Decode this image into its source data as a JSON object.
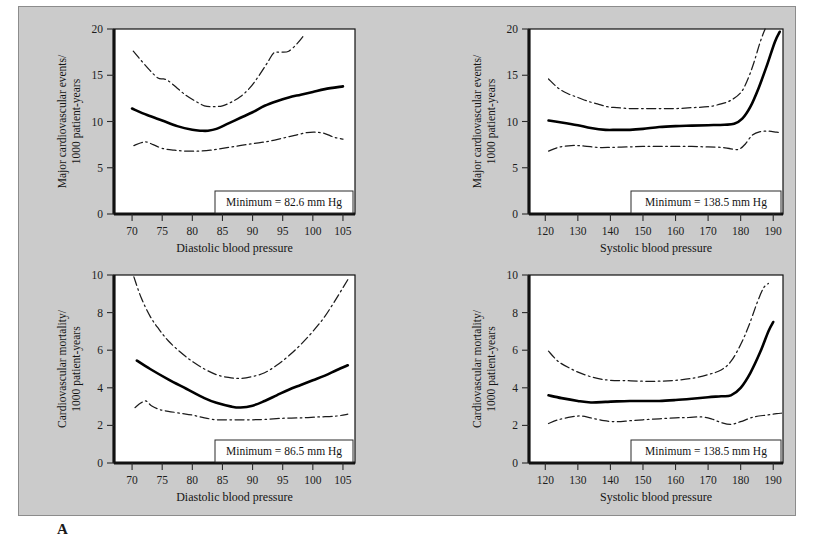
{
  "figure": {
    "panel_label": "A",
    "background_color": "#cbcbcb",
    "plot_background_color": "#ffffff",
    "curve_color": "#000000",
    "ci_color": "#1b1b1b"
  },
  "chart_data": [
    {
      "id": "top-left",
      "type": "line",
      "title": "",
      "xlabel": "Diastolic blood pressure",
      "ylabel": "Major cardiovascular events/\n1000 patient-years",
      "ylabel_line1": "Major cardiovascular events/",
      "ylabel_line2": "1000 patient-years",
      "xlim": [
        67,
        107
      ],
      "ylim": [
        0,
        20
      ],
      "xticks": [
        70,
        75,
        80,
        85,
        90,
        95,
        100,
        105
      ],
      "yticks": [
        0,
        5,
        10,
        15,
        20
      ],
      "grid": false,
      "legend": "none",
      "annotation": "Minimum = 82.6 mm Hg",
      "minimum_value": 82.6,
      "minimum_units": "mm Hg",
      "series": [
        {
          "name": "upper-confidence-limit",
          "style": "dash-dot",
          "x": [
            70.2,
            71.5,
            73.0,
            74.3,
            75.2,
            76.0,
            77.5,
            79.0,
            80.5,
            82.0,
            83.5,
            85.0,
            86.5,
            88.0,
            89.5,
            91.0,
            92.5,
            93.5,
            94.5,
            96.0,
            97.5,
            98.5
          ],
          "y": [
            17.6,
            16.6,
            15.5,
            14.7,
            14.6,
            14.4,
            13.6,
            12.8,
            12.2,
            11.7,
            11.6,
            11.7,
            12.1,
            12.7,
            13.6,
            14.9,
            16.4,
            17.4,
            17.5,
            17.6,
            18.5,
            19.3
          ]
        },
        {
          "name": "fitted-risk",
          "style": "solid",
          "x": [
            70.0,
            72.5,
            75.0,
            77.5,
            80.0,
            81.5,
            82.6,
            84.0,
            86.0,
            88.0,
            90.0,
            92.0,
            94.0,
            96.0,
            98.0,
            100.0,
            102.0,
            105.0
          ],
          "y": [
            11.4,
            10.7,
            10.1,
            9.5,
            9.1,
            9.0,
            9.0,
            9.2,
            9.8,
            10.4,
            11.0,
            11.7,
            12.2,
            12.6,
            12.9,
            13.2,
            13.5,
            13.8
          ]
        },
        {
          "name": "lower-confidence-limit",
          "style": "dash-dot",
          "x": [
            70.3,
            71.5,
            72.3,
            73.5,
            75.0,
            77.0,
            79.0,
            81.0,
            83.0,
            85.0,
            87.0,
            89.0,
            91.0,
            93.0,
            95.0,
            97.0,
            99.0,
            100.5,
            102.0,
            103.5,
            105.0
          ],
          "y": [
            7.4,
            7.7,
            7.8,
            7.5,
            7.1,
            6.9,
            6.8,
            6.8,
            6.9,
            7.1,
            7.3,
            7.5,
            7.7,
            7.9,
            8.2,
            8.5,
            8.8,
            8.85,
            8.7,
            8.3,
            8.1
          ]
        }
      ]
    },
    {
      "id": "top-right",
      "type": "line",
      "title": "",
      "xlabel": "Systolic blood pressure",
      "ylabel_line1": "Major cardiovascular events/",
      "ylabel_line2": "1000 patient-years",
      "xlim": [
        115,
        193
      ],
      "ylim": [
        0,
        20
      ],
      "xticks": [
        120,
        130,
        140,
        150,
        160,
        170,
        180,
        190
      ],
      "yticks": [
        0,
        5,
        10,
        15,
        20
      ],
      "grid": false,
      "legend": "none",
      "annotation": "Minimum = 138.5 mm Hg",
      "minimum_value": 138.5,
      "minimum_units": "mm Hg",
      "series": [
        {
          "name": "upper-confidence-limit",
          "style": "dash-dot",
          "x": [
            121.0,
            124.0,
            127.0,
            130.0,
            133.0,
            136.0,
            139.0,
            142.0,
            146.0,
            150.0,
            155.0,
            160.0,
            165.0,
            170.0,
            174.0,
            177.0,
            180.0,
            182.0,
            184.0,
            186.0,
            187.5
          ],
          "y": [
            14.6,
            13.6,
            13.0,
            12.6,
            12.2,
            11.9,
            11.6,
            11.5,
            11.4,
            11.4,
            11.4,
            11.4,
            11.5,
            11.6,
            11.9,
            12.3,
            13.1,
            14.4,
            16.3,
            18.6,
            20.0
          ]
        },
        {
          "name": "fitted-risk",
          "style": "solid",
          "x": [
            121.0,
            125.0,
            130.0,
            134.0,
            138.5,
            142.0,
            146.0,
            150.0,
            155.0,
            160.0,
            165.0,
            170.0,
            175.0,
            178.0,
            180.5,
            183.0,
            185.5,
            188.0,
            190.5,
            192.0
          ],
          "y": [
            10.1,
            9.9,
            9.6,
            9.3,
            9.1,
            9.1,
            9.1,
            9.2,
            9.4,
            9.5,
            9.55,
            9.6,
            9.65,
            9.75,
            10.3,
            11.6,
            13.6,
            16.0,
            18.6,
            19.7
          ]
        },
        {
          "name": "lower-confidence-limit",
          "style": "dash-dot",
          "x": [
            121.0,
            124.0,
            128.0,
            132.0,
            136.0,
            140.0,
            145.0,
            150.0,
            155.0,
            160.0,
            165.0,
            170.0,
            174.0,
            177.0,
            179.5,
            181.5,
            183.5,
            186.0,
            188.5,
            191.0,
            192.5
          ],
          "y": [
            6.8,
            7.2,
            7.4,
            7.35,
            7.2,
            7.2,
            7.25,
            7.3,
            7.3,
            7.3,
            7.3,
            7.25,
            7.2,
            7.05,
            7.0,
            7.6,
            8.5,
            8.9,
            8.95,
            8.85,
            8.8
          ]
        }
      ]
    },
    {
      "id": "bottom-left",
      "type": "line",
      "title": "",
      "xlabel": "Diastolic blood pressure",
      "ylabel_line1": "Cardiovascular mortality/",
      "ylabel_line2": "1000 patient-years",
      "xlim": [
        67,
        107
      ],
      "ylim": [
        0,
        10
      ],
      "xticks": [
        70,
        75,
        80,
        85,
        90,
        95,
        100,
        105
      ],
      "yticks": [
        0,
        2,
        4,
        6,
        8,
        10
      ],
      "grid": false,
      "legend": "none",
      "annotation": "Minimum = 86.5 mm Hg",
      "minimum_value": 86.5,
      "minimum_units": "mm Hg",
      "series": [
        {
          "name": "upper-confidence-limit",
          "style": "dash-dot",
          "x": [
            70.3,
            71.5,
            73.0,
            74.5,
            76.0,
            78.0,
            80.0,
            82.0,
            84.0,
            86.0,
            88.0,
            90.0,
            92.0,
            94.0,
            96.0,
            98.0,
            100.0,
            102.0,
            104.0,
            105.8
          ],
          "y": [
            9.9,
            8.8,
            7.8,
            7.1,
            6.5,
            5.9,
            5.4,
            5.0,
            4.7,
            4.55,
            4.5,
            4.6,
            4.8,
            5.2,
            5.7,
            6.3,
            7.0,
            7.8,
            8.8,
            9.75
          ]
        },
        {
          "name": "fitted-risk",
          "style": "solid",
          "x": [
            70.8,
            73.0,
            76.0,
            79.0,
            82.0,
            84.0,
            86.5,
            88.0,
            90.0,
            92.0,
            94.0,
            96.0,
            98.0,
            100.0,
            102.0,
            104.0,
            105.8
          ],
          "y": [
            5.45,
            5.0,
            4.45,
            3.95,
            3.45,
            3.2,
            3.0,
            2.95,
            3.05,
            3.3,
            3.6,
            3.9,
            4.15,
            4.4,
            4.65,
            4.95,
            5.2
          ]
        },
        {
          "name": "lower-confidence-limit",
          "style": "dash-dot",
          "x": [
            70.5,
            71.5,
            72.3,
            73.2,
            74.5,
            76.0,
            78.0,
            80.0,
            82.0,
            84.0,
            86.0,
            88.0,
            90.0,
            92.0,
            95.0,
            98.0,
            101.0,
            104.0,
            105.8
          ],
          "y": [
            2.95,
            3.2,
            3.3,
            3.05,
            2.85,
            2.75,
            2.65,
            2.55,
            2.4,
            2.3,
            2.3,
            2.3,
            2.3,
            2.32,
            2.38,
            2.4,
            2.45,
            2.5,
            2.6
          ]
        }
      ]
    },
    {
      "id": "bottom-right",
      "type": "line",
      "title": "",
      "xlabel": "Systolic blood pressure",
      "ylabel_line1": "Cardiovascular mortality/",
      "ylabel_line2": "1000 patient-years",
      "xlim": [
        115,
        193
      ],
      "ylim": [
        0,
        10
      ],
      "xticks": [
        120,
        130,
        140,
        150,
        160,
        170,
        180,
        190
      ],
      "yticks": [
        0,
        2,
        4,
        6,
        8,
        10
      ],
      "grid": false,
      "legend": "none",
      "annotation": "Minimum = 138.5 mm Hg",
      "minimum_value": 138.5,
      "minimum_units": "mm Hg",
      "series": [
        {
          "name": "upper-confidence-limit",
          "style": "dash-dot",
          "x": [
            121.0,
            124.0,
            128.0,
            132.0,
            136.0,
            140.0,
            145.0,
            150.0,
            155.0,
            160.0,
            165.0,
            170.0,
            174.0,
            177.0,
            180.0,
            182.5,
            185.0,
            187.0,
            188.5
          ],
          "y": [
            5.95,
            5.4,
            5.0,
            4.7,
            4.5,
            4.4,
            4.38,
            4.35,
            4.35,
            4.4,
            4.5,
            4.7,
            4.95,
            5.4,
            6.3,
            7.3,
            8.5,
            9.3,
            9.55
          ]
        },
        {
          "name": "fitted-risk",
          "style": "solid",
          "x": [
            121.0,
            125.0,
            130.0,
            134.0,
            138.5,
            142.0,
            146.0,
            150.0,
            155.0,
            160.0,
            165.0,
            170.0,
            174.0,
            177.0,
            180.0,
            183.0,
            186.0,
            188.5,
            190.0
          ],
          "y": [
            3.6,
            3.45,
            3.3,
            3.22,
            3.25,
            3.28,
            3.3,
            3.3,
            3.3,
            3.35,
            3.42,
            3.5,
            3.55,
            3.6,
            4.0,
            4.8,
            5.9,
            7.0,
            7.5
          ]
        },
        {
          "name": "lower-confidence-limit",
          "style": "dash-dot",
          "x": [
            121.0,
            124.0,
            128.0,
            131.0,
            134.0,
            138.0,
            142.0,
            146.0,
            150.0,
            155.0,
            160.0,
            164.0,
            168.0,
            171.0,
            174.0,
            177.0,
            180.0,
            184.0,
            188.0,
            191.0,
            192.5
          ],
          "y": [
            2.1,
            2.3,
            2.45,
            2.5,
            2.4,
            2.25,
            2.2,
            2.25,
            2.3,
            2.35,
            2.4,
            2.42,
            2.45,
            2.35,
            2.15,
            2.05,
            2.2,
            2.45,
            2.55,
            2.62,
            2.65
          ]
        }
      ]
    }
  ]
}
